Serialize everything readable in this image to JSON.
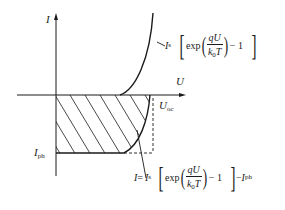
{
  "diagram": {
    "type": "solar-cell-iv-curve",
    "axes": {
      "y_label": "I",
      "x_label": "U"
    },
    "labels": {
      "photocurrent": {
        "main": "I",
        "sub": "ph"
      },
      "open_circuit_voltage": {
        "main": "U",
        "sub": "oc"
      }
    },
    "dark_curve_formula": {
      "prefix": "I",
      "prefix_sub": "s",
      "func": "exp",
      "numerator": "qU",
      "denominator_main": "k",
      "denominator_sub": "0",
      "denominator_tail": "T",
      "minus_one": "− 1"
    },
    "illuminated_curve_formula": {
      "lhs": "I",
      "equals": "=",
      "prefix": "I",
      "prefix_sub": "s",
      "func": "exp",
      "numerator": "qU",
      "denominator_main": "k",
      "denominator_sub": "0",
      "denominator_tail": "T",
      "minus_one": "− 1",
      "tail_minus": "−",
      "tail_main": "I",
      "tail_sub": "ph"
    },
    "regions": {
      "hatched": "power-generation-region (fourth quadrant)"
    },
    "colors": {
      "ink": "#1a1a1a",
      "background": "#ffffff"
    }
  }
}
